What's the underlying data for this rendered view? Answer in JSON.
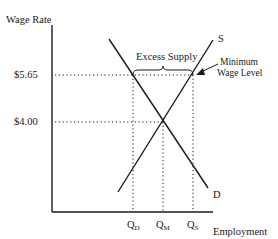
{
  "diagram": {
    "y_axis_label": "Wage Rate",
    "x_axis_label": "Employment",
    "y_ticks": [
      {
        "label": "$5.65",
        "meaning": "minimum wage"
      },
      {
        "label": "$4.00",
        "meaning": "equilibrium wage"
      }
    ],
    "x_ticks": [
      {
        "main": "Q",
        "sub": "D"
      },
      {
        "main": "Q",
        "sub": "M"
      },
      {
        "main": "Q",
        "sub": "S"
      }
    ],
    "curves": {
      "supply_label": "S",
      "demand_label": "D"
    },
    "annotations": {
      "excess_supply": "Excess Supply",
      "min_wage_line1": "Minimum",
      "min_wage_line2": "Wage Level"
    },
    "colors": {
      "line": "#1a1a1a",
      "background": "#ffffff"
    }
  }
}
